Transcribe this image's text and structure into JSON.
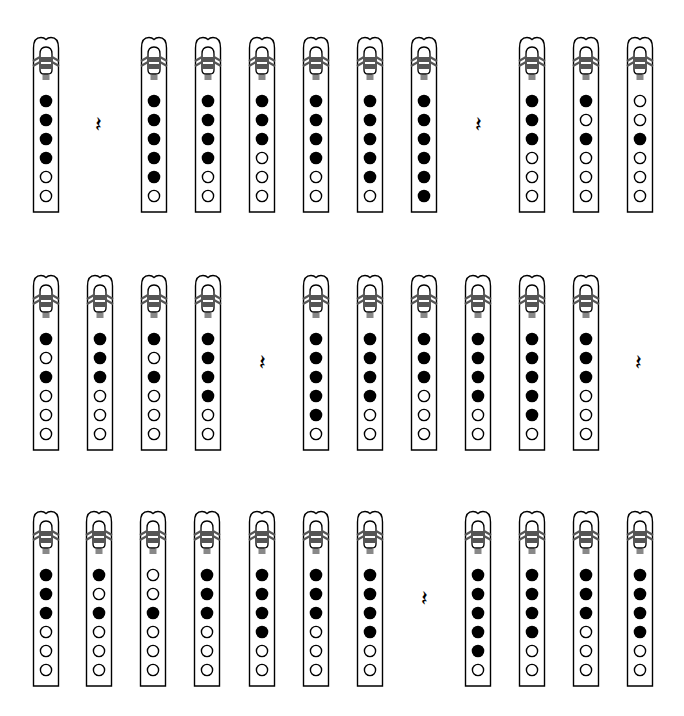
{
  "diagram": {
    "type": "tin-whistle fingering chart",
    "legend": {
      "closed_hole": "filled black circle",
      "open_hole": "hollow circle",
      "rest": "quarter rest"
    },
    "colors": {
      "ink": "#000000",
      "background": "#ffffff",
      "band": "#555555",
      "windway": "#888888"
    },
    "rest_glyph": "𝄽",
    "rows": [
      {
        "top": 36,
        "items": [
          {
            "kind": "flute",
            "x": 46,
            "holes": [
              1,
              1,
              1,
              1,
              0,
              0
            ]
          },
          {
            "kind": "rest",
            "x": 98
          },
          {
            "kind": "flute",
            "x": 154,
            "holes": [
              1,
              1,
              1,
              1,
              1,
              0
            ]
          },
          {
            "kind": "flute",
            "x": 208,
            "holes": [
              1,
              1,
              1,
              1,
              0,
              0
            ]
          },
          {
            "kind": "flute",
            "x": 262,
            "holes": [
              1,
              1,
              1,
              0,
              0,
              0
            ]
          },
          {
            "kind": "flute",
            "x": 316,
            "holes": [
              1,
              1,
              1,
              1,
              0,
              0
            ]
          },
          {
            "kind": "flute",
            "x": 370,
            "holes": [
              1,
              1,
              1,
              1,
              1,
              0
            ]
          },
          {
            "kind": "flute",
            "x": 424,
            "holes": [
              1,
              1,
              1,
              1,
              1,
              1
            ]
          },
          {
            "kind": "rest",
            "x": 478
          },
          {
            "kind": "flute",
            "x": 532,
            "holes": [
              1,
              1,
              1,
              0,
              0,
              0
            ]
          },
          {
            "kind": "flute",
            "x": 586,
            "holes": [
              1,
              0,
              1,
              0,
              0,
              0
            ]
          },
          {
            "kind": "flute",
            "x": 640,
            "holes": [
              0,
              0,
              1,
              0,
              0,
              0
            ]
          }
        ]
      },
      {
        "top": 274,
        "items": [
          {
            "kind": "flute",
            "x": 46,
            "holes": [
              1,
              0,
              1,
              0,
              0,
              0
            ]
          },
          {
            "kind": "flute",
            "x": 100,
            "holes": [
              1,
              1,
              1,
              0,
              0,
              0
            ]
          },
          {
            "kind": "flute",
            "x": 154,
            "holes": [
              1,
              0,
              1,
              0,
              0,
              0
            ]
          },
          {
            "kind": "flute",
            "x": 208,
            "holes": [
              1,
              1,
              1,
              1,
              0,
              0
            ]
          },
          {
            "kind": "rest",
            "x": 262
          },
          {
            "kind": "flute",
            "x": 316,
            "holes": [
              1,
              1,
              1,
              1,
              1,
              0
            ]
          },
          {
            "kind": "flute",
            "x": 370,
            "holes": [
              1,
              1,
              1,
              1,
              0,
              0
            ]
          },
          {
            "kind": "flute",
            "x": 424,
            "holes": [
              1,
              1,
              1,
              0,
              0,
              0
            ]
          },
          {
            "kind": "flute",
            "x": 478,
            "holes": [
              1,
              1,
              1,
              1,
              0,
              0
            ]
          },
          {
            "kind": "flute",
            "x": 532,
            "holes": [
              1,
              1,
              1,
              1,
              1,
              0
            ]
          },
          {
            "kind": "flute",
            "x": 586,
            "holes": [
              1,
              1,
              1,
              0,
              0,
              0
            ]
          },
          {
            "kind": "rest",
            "x": 638
          }
        ]
      },
      {
        "top": 510,
        "items": [
          {
            "kind": "flute",
            "x": 46,
            "holes": [
              1,
              1,
              1,
              0,
              0,
              0
            ]
          },
          {
            "kind": "flute",
            "x": 99,
            "holes": [
              1,
              0,
              1,
              0,
              0,
              0
            ]
          },
          {
            "kind": "flute",
            "x": 153,
            "holes": [
              0,
              0,
              1,
              0,
              0,
              0
            ]
          },
          {
            "kind": "flute",
            "x": 207,
            "holes": [
              1,
              1,
              1,
              0,
              0,
              0
            ]
          },
          {
            "kind": "flute",
            "x": 262,
            "holes": [
              1,
              1,
              1,
              1,
              0,
              0
            ]
          },
          {
            "kind": "flute",
            "x": 316,
            "holes": [
              1,
              1,
              1,
              0,
              0,
              0
            ]
          },
          {
            "kind": "flute",
            "x": 370,
            "holes": [
              1,
              1,
              1,
              1,
              0,
              0
            ]
          },
          {
            "kind": "rest",
            "x": 424
          },
          {
            "kind": "flute",
            "x": 478,
            "holes": [
              1,
              1,
              1,
              1,
              1,
              0
            ]
          },
          {
            "kind": "flute",
            "x": 532,
            "holes": [
              1,
              1,
              1,
              1,
              0,
              0
            ]
          },
          {
            "kind": "flute",
            "x": 586,
            "holes": [
              1,
              1,
              1,
              0,
              0,
              0
            ]
          },
          {
            "kind": "flute",
            "x": 640,
            "holes": [
              1,
              1,
              1,
              1,
              0,
              0
            ]
          }
        ]
      }
    ]
  }
}
